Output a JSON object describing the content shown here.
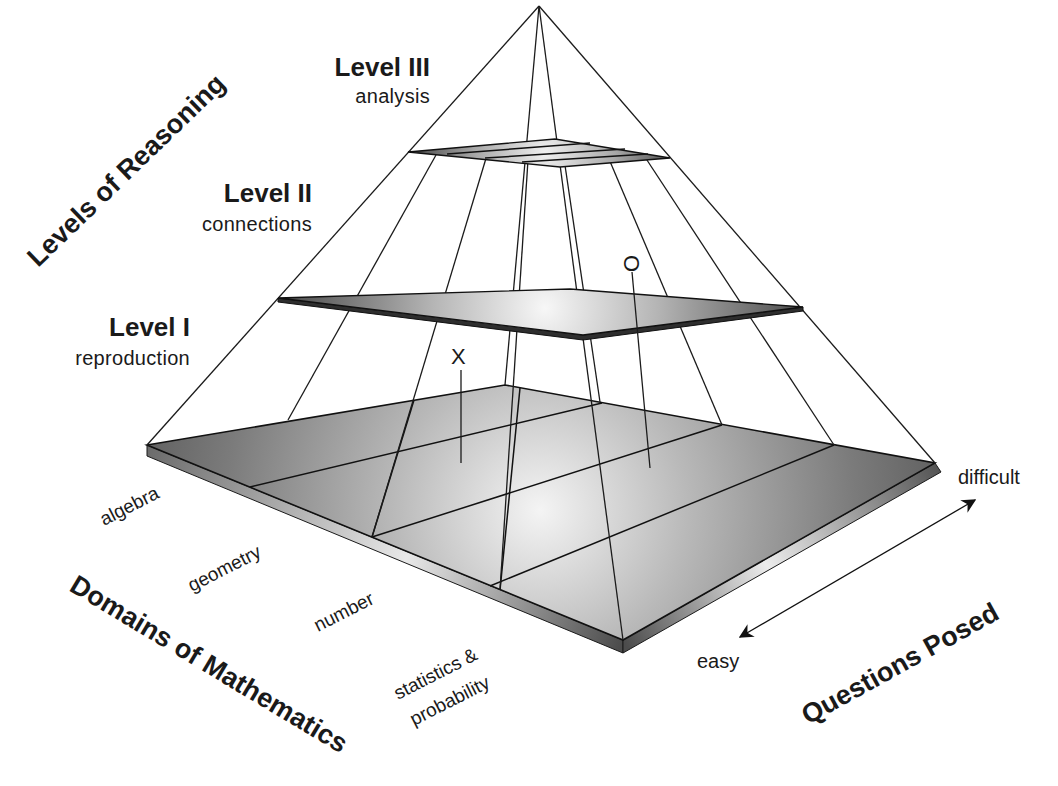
{
  "diagram": {
    "type": "pyramid-framework",
    "levels_axis_title": "Levels of Reasoning",
    "levels": [
      {
        "id": "level-3",
        "title": "Level III",
        "subtitle": "analysis"
      },
      {
        "id": "level-2",
        "title": "Level II",
        "subtitle": "connections"
      },
      {
        "id": "level-1",
        "title": "Level I",
        "subtitle": "reproduction"
      }
    ],
    "domains_axis_title": "Domains of Mathematics",
    "domains": [
      {
        "id": "algebra",
        "label": "algebra"
      },
      {
        "id": "geometry",
        "label": "geometry"
      },
      {
        "id": "number",
        "label": "number"
      },
      {
        "id": "statistics",
        "label_line1": "statistics &",
        "label_line2": "probability"
      }
    ],
    "questions_axis_title": "Questions Posed",
    "questions_scale": {
      "low": "easy",
      "high": "difficult"
    },
    "markers": [
      {
        "id": "x-marker",
        "glyph": "X"
      },
      {
        "id": "o-marker",
        "glyph": "O"
      }
    ],
    "colors": {
      "outline": "#1b1b1b",
      "plane_dark": "#5a5a5a",
      "plane_light": "#f2f2f2",
      "text": "#1a1a1a"
    }
  }
}
